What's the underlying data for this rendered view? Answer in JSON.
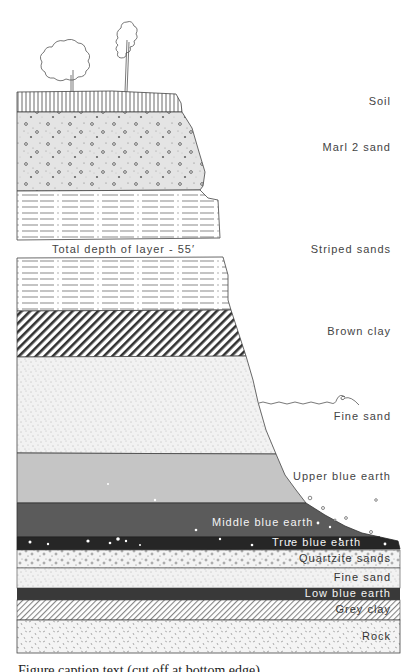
{
  "diagram": {
    "title_annotation": "Total depth of layer - 55′",
    "layers": [
      {
        "name": "Soil",
        "pattern": "vertical-lines",
        "fill": "#ffffff"
      },
      {
        "name": "Marl 2 sand",
        "pattern": "stipple-pebbles",
        "fill": "#e6e6e6"
      },
      {
        "name": "Striped sands",
        "pattern": "dashed-horizontal",
        "fill": "#ffffff"
      },
      {
        "name": "Brown clay",
        "pattern": "thick-diagonal-hatch",
        "fill": "#ffffff"
      },
      {
        "name": "Fine sand",
        "pattern": "fine-stipple",
        "fill": "#f3f3f3"
      },
      {
        "name": "Upper blue earth",
        "pattern": "solid",
        "fill": "#c4c4c4"
      },
      {
        "name": "Middle blue earth",
        "pattern": "solid",
        "fill": "#5c5c5c"
      },
      {
        "name": "True blue earth",
        "pattern": "solid-speckled",
        "fill": "#2a2a2a"
      },
      {
        "name": "Quartzite sands",
        "pattern": "pebbles",
        "fill": "#f1f1f1"
      },
      {
        "name": "Fine sand",
        "pattern": "fine-stipple",
        "fill": "#f3f3f3"
      },
      {
        "name": "Low blue earth",
        "pattern": "solid",
        "fill": "#3a3a3a"
      },
      {
        "name": "Grey clay",
        "pattern": "thin-diagonal-hatch",
        "fill": "#ffffff"
      },
      {
        "name": "Rock",
        "pattern": "dash-specks",
        "fill": "#f4f4f4"
      }
    ],
    "labels": {
      "soil": "Soil",
      "marl": "Marl 2 sand",
      "striped": "Striped sands",
      "brown_clay": "Brown clay",
      "fine_sand_upper": "Fine sand",
      "upper_blue": "Upper blue earth",
      "middle_blue": "Middle blue earth",
      "true_blue": "True blue earth",
      "quartzite": "Quartzite sands",
      "fine_sand_lower": "Fine sand",
      "low_blue": "Low blue earth",
      "grey_clay": "Grey clay",
      "rock": "Rock"
    },
    "features": [
      "trees-on-top",
      "water-line",
      "scattered-pebbles-on-slope"
    ],
    "cut_off_caption": "Figure caption text (cut off at bottom edge)"
  }
}
